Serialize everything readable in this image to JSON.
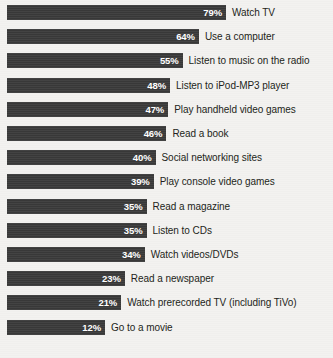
{
  "chart_data": {
    "type": "bar",
    "orientation": "horizontal",
    "title": "",
    "subtitle": "",
    "xlabel": "",
    "ylabel": "",
    "grid": false,
    "legend": null,
    "value_suffix": "%",
    "xlim": [
      0,
      100
    ],
    "categories": [
      "Watch TV",
      "Use a computer",
      "Listen to music on the radio",
      "Listen to iPod-MP3 player",
      "Play handheld video games",
      "Read a book",
      "Social networking sites",
      "Play console video games",
      "Read a magazine",
      "Listen to CDs",
      "Watch videos/DVDs",
      "Read a newspaper",
      "Watch prerecorded TV (including TiVo)",
      "Go to a movie"
    ],
    "values": [
      79,
      64,
      55,
      48,
      47,
      46,
      40,
      39,
      35,
      35,
      34,
      23,
      21,
      12
    ],
    "value_labels": [
      "79%",
      "64%",
      "55%",
      "48%",
      "47%",
      "46%",
      "40%",
      "39%",
      "35%",
      "35%",
      "34%",
      "23%",
      "21%",
      "12%"
    ],
    "colors": {
      "bar": "#3b3b3b",
      "value_text": "#ffffff",
      "label_text": "#231f20",
      "background": "#f2f1ef"
    }
  },
  "rows": [
    {
      "label": "Watch TV",
      "value_label": "79%",
      "value": 79
    },
    {
      "label": "Use a computer",
      "value_label": "64%",
      "value": 64
    },
    {
      "label": "Listen to music on the radio",
      "value_label": "55%",
      "value": 55
    },
    {
      "label": "Listen to iPod-MP3 player",
      "value_label": "48%",
      "value": 48
    },
    {
      "label": "Play handheld video games",
      "value_label": "47%",
      "value": 47
    },
    {
      "label": "Read a book",
      "value_label": "46%",
      "value": 46
    },
    {
      "label": "Social networking sites",
      "value_label": "40%",
      "value": 40
    },
    {
      "label": "Play console video games",
      "value_label": "39%",
      "value": 39
    },
    {
      "label": "Read a magazine",
      "value_label": "35%",
      "value": 35
    },
    {
      "label": "Listen to CDs",
      "value_label": "35%",
      "value": 35
    },
    {
      "label": "Watch videos/DVDs",
      "value_label": "34%",
      "value": 34
    },
    {
      "label": "Read a newspaper",
      "value_label": "23%",
      "value": 23
    },
    {
      "label": "Watch prerecorded TV (including TiVo)",
      "value_label": "21%",
      "value": 21
    },
    {
      "label": "Go to a movie",
      "value_label": "12%",
      "value": 12
    }
  ],
  "layout": {
    "bar_left": 7,
    "bar_height": 15,
    "row_pitch": 24.2,
    "first_row_top": 5,
    "width_slope": 1.806,
    "width_intercept": 76.3,
    "label_gap": 6
  }
}
